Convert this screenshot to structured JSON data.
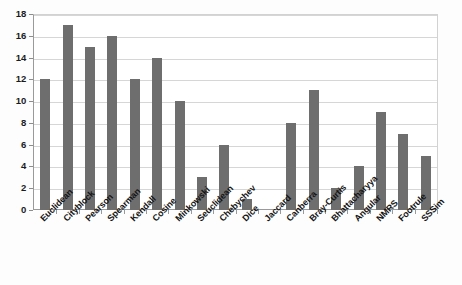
{
  "chart_data": {
    "type": "bar",
    "title": "",
    "subtitle": "",
    "xlabel": "",
    "ylabel": "",
    "ylim": [
      0,
      18
    ],
    "ytick_step": 2,
    "yticks": [
      0,
      2,
      4,
      6,
      8,
      10,
      12,
      14,
      16,
      18
    ],
    "grid": true,
    "legend": null,
    "legend_position": "none",
    "annotations": [],
    "bar_color": "#6e6e6e",
    "gridline_color": "#d6d6d6",
    "axis_color": "#9a9a9a",
    "background_color": "#ffffff",
    "categories": [
      "Euclidean",
      "Cityblock",
      "Pearson",
      "Spearman",
      "Kendall",
      "Cosine",
      "Minkowski",
      "Seuclidean",
      "Chebychev",
      "Dice",
      "Jaccard",
      "Canberra",
      "Bray-Curtis",
      "Bhattacharyya",
      "Angular",
      "NMRS",
      "Footrule",
      "SSSim"
    ],
    "values": [
      12,
      17,
      15,
      16,
      12,
      14,
      10,
      3,
      6,
      1,
      0,
      8,
      11,
      2,
      4,
      9,
      7,
      5
    ]
  }
}
